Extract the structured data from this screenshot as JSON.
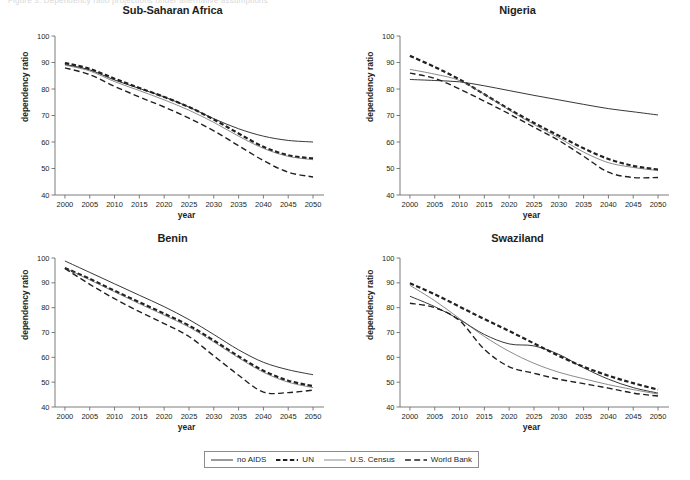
{
  "figure": {
    "cut_header_text": "Figure 3. Dependency ratio projections under alternative assumptions",
    "width": 690,
    "height": 480,
    "background": "#ffffff",
    "axis_color": "#6d6e71",
    "text_color": "#231f20"
  },
  "legend": {
    "name": "series-legend",
    "border_color": "#8c8c8c",
    "entries": [
      {
        "label": "no AIDS",
        "style": "solid",
        "width": 0.9,
        "color": "#231f20"
      },
      {
        "label": "UN",
        "style": "thick-dash",
        "width": 2.2,
        "color": "#231f20"
      },
      {
        "label": "U.S. Census",
        "style": "solid",
        "width": 0.7,
        "color": "#58595b"
      },
      {
        "label": "World Bank",
        "style": "long-dash",
        "width": 1.4,
        "color": "#231f20"
      }
    ]
  },
  "axes": {
    "xlabel": "year",
    "ylabel": "dependency ratio",
    "xticks": [
      2000,
      2005,
      2010,
      2015,
      2020,
      2025,
      2030,
      2035,
      2040,
      2045,
      2050
    ],
    "yticks": [
      40,
      50,
      60,
      70,
      80,
      90,
      100
    ],
    "xlim": [
      1998,
      2051
    ],
    "ylim": [
      40,
      100
    ],
    "grid": false
  },
  "chart_data": [
    {
      "type": "line",
      "title": "Sub-Saharan Africa",
      "xlabel": "year",
      "ylabel": "dependency ratio",
      "xlim": [
        1998,
        2051
      ],
      "ylim": [
        40,
        100
      ],
      "grid": false,
      "legend_position": "below-figure",
      "x": [
        2000,
        2005,
        2010,
        2015,
        2020,
        2025,
        2030,
        2035,
        2040,
        2045,
        2050
      ],
      "series": [
        {
          "name": "no AIDS",
          "values": [
            89.3,
            87.2,
            83.4,
            80.2,
            77.0,
            73.2,
            68.8,
            65.0,
            62.2,
            60.6,
            60.0
          ]
        },
        {
          "name": "UN",
          "values": [
            89.8,
            87.6,
            83.9,
            80.4,
            77.0,
            73.2,
            68.5,
            63.2,
            58.2,
            55.0,
            53.8
          ]
        },
        {
          "name": "U.S. Census",
          "values": [
            89.0,
            86.8,
            82.8,
            79.4,
            75.9,
            72.0,
            67.4,
            62.2,
            57.6,
            54.6,
            53.3
          ]
        },
        {
          "name": "World Bank",
          "values": [
            88.0,
            85.4,
            81.0,
            77.0,
            73.2,
            69.0,
            64.2,
            58.6,
            53.0,
            48.6,
            46.8
          ]
        }
      ]
    },
    {
      "type": "line",
      "title": "Nigeria",
      "xlabel": "year",
      "ylabel": "dependency ratio",
      "xlim": [
        1998,
        2051
      ],
      "ylim": [
        40,
        100
      ],
      "grid": false,
      "legend_position": "below-figure",
      "x": [
        2000,
        2005,
        2010,
        2015,
        2020,
        2025,
        2030,
        2035,
        2040,
        2045,
        2050
      ],
      "series": [
        {
          "name": "no AIDS",
          "values": [
            83.6,
            83.2,
            82.7,
            81.2,
            79.4,
            77.6,
            75.9,
            74.2,
            72.6,
            71.4,
            70.2
          ]
        },
        {
          "name": "UN",
          "values": [
            92.5,
            88.3,
            83.6,
            78.0,
            72.4,
            67.2,
            62.4,
            57.6,
            53.6,
            51.0,
            49.6
          ]
        },
        {
          "name": "U.S. Census",
          "values": [
            87.4,
            85.6,
            83.2,
            78.0,
            72.0,
            66.6,
            61.6,
            56.2,
            52.2,
            50.4,
            49.2
          ]
        },
        {
          "name": "World Bank",
          "values": [
            86.0,
            84.0,
            80.0,
            75.4,
            70.6,
            65.6,
            60.6,
            54.6,
            48.6,
            46.6,
            46.6
          ]
        }
      ]
    },
    {
      "type": "line",
      "title": "Benin",
      "xlabel": "year",
      "ylabel": "dependency ratio",
      "xlim": [
        1998,
        2051
      ],
      "ylim": [
        40,
        100
      ],
      "grid": false,
      "legend_position": "below-figure",
      "x": [
        2000,
        2005,
        2010,
        2015,
        2020,
        2025,
        2030,
        2035,
        2040,
        2045,
        2050
      ],
      "series": [
        {
          "name": "no AIDS",
          "values": [
            98.8,
            94.2,
            89.6,
            85.0,
            80.4,
            75.2,
            69.2,
            63.0,
            58.0,
            55.0,
            53.0
          ]
        },
        {
          "name": "UN",
          "values": [
            96.0,
            91.6,
            86.8,
            82.2,
            77.6,
            72.8,
            66.8,
            60.4,
            54.6,
            50.6,
            48.4
          ]
        },
        {
          "name": "U.S. Census",
          "values": [
            96.0,
            91.2,
            86.4,
            81.6,
            77.0,
            72.2,
            66.2,
            59.8,
            54.0,
            50.0,
            47.8
          ]
        },
        {
          "name": "World Bank",
          "values": [
            95.8,
            89.4,
            83.6,
            78.4,
            73.6,
            68.4,
            60.6,
            52.8,
            46.0,
            45.8,
            46.8
          ]
        }
      ]
    },
    {
      "type": "line",
      "title": "Swaziland",
      "xlabel": "year",
      "ylabel": "dependency ratio",
      "xlim": [
        1998,
        2051
      ],
      "ylim": [
        40,
        100
      ],
      "grid": false,
      "legend_position": "below-figure",
      "x": [
        2000,
        2005,
        2010,
        2015,
        2020,
        2025,
        2030,
        2035,
        2040,
        2045,
        2050
      ],
      "series": [
        {
          "name": "no AIDS",
          "values": [
            84.6,
            80.4,
            75.2,
            69.2,
            65.4,
            64.6,
            61.2,
            55.8,
            51.2,
            47.8,
            45.6
          ]
        },
        {
          "name": "UN",
          "values": [
            89.8,
            85.4,
            80.4,
            75.4,
            70.6,
            65.6,
            60.6,
            56.2,
            52.6,
            49.6,
            47.0
          ]
        },
        {
          "name": "U.S. Census",
          "values": [
            89.0,
            82.8,
            75.6,
            68.4,
            62.4,
            57.6,
            54.0,
            51.4,
            49.0,
            47.0,
            45.2
          ]
        },
        {
          "name": "World Bank",
          "values": [
            81.8,
            80.0,
            74.8,
            63.2,
            56.2,
            53.6,
            51.2,
            49.4,
            47.6,
            45.6,
            44.4
          ]
        }
      ]
    }
  ]
}
